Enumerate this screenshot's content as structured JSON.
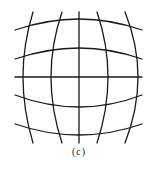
{
  "figure": {
    "caption": "(c)",
    "stroke_color": "#1a1a1a",
    "background": "#ffffff",
    "vertical_lines": [
      {
        "top": [
          33,
          12
        ],
        "mid": [
          23,
          77
        ],
        "bottom": [
          33,
          143
        ]
      },
      {
        "top": [
          62,
          12
        ],
        "mid": [
          51,
          77
        ],
        "bottom": [
          62,
          143
        ]
      },
      {
        "top": [
          79,
          12
        ],
        "mid": [
          79,
          77
        ],
        "bottom": [
          79,
          143
        ]
      },
      {
        "top": [
          97,
          12
        ],
        "mid": [
          108,
          77
        ],
        "bottom": [
          97,
          143
        ]
      },
      {
        "top": [
          125,
          12
        ],
        "mid": [
          138,
          77
        ],
        "bottom": [
          125,
          143
        ]
      }
    ],
    "horizontal_lines": [
      {
        "left": [
          15,
          30
        ],
        "mid": [
          79,
          19
        ],
        "right": [
          142,
          30
        ]
      },
      {
        "left": [
          15,
          59
        ],
        "mid": [
          79,
          48
        ],
        "right": [
          142,
          59
        ]
      },
      {
        "left": [
          15,
          77
        ],
        "mid": [
          79,
          77
        ],
        "right": [
          142,
          77
        ]
      },
      {
        "left": [
          15,
          95
        ],
        "mid": [
          79,
          107
        ],
        "right": [
          142,
          95
        ]
      },
      {
        "left": [
          15,
          124
        ],
        "mid": [
          79,
          135
        ],
        "right": [
          142,
          124
        ]
      }
    ]
  }
}
